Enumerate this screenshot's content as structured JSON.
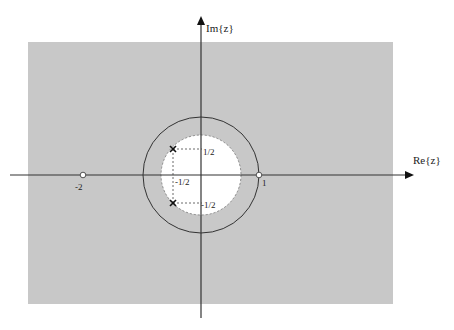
{
  "diagram": {
    "type": "pole-zero plot (z-plane, region of convergence)",
    "axes": {
      "real_label": "Re{z}",
      "imag_label": "Im{z}"
    },
    "roc": {
      "description": "shaded region |z| > 1/sqrt(2)",
      "shade_color": "#c8c8c8",
      "inner_disk_color": "#ffffff"
    },
    "unit_circle": {
      "radius": 1,
      "color": "#333333"
    },
    "zeros": [
      {
        "re": -2,
        "im": 0,
        "label": "-2"
      },
      {
        "re": 1,
        "im": 0,
        "label": "1"
      }
    ],
    "poles": [
      {
        "re": -0.5,
        "im": 0.5
      },
      {
        "re": -0.5,
        "im": -0.5
      }
    ],
    "guide_labels": {
      "pole_upper_im": "1/2",
      "pole_lower_im": "-1/2",
      "pole_re": "-1/2"
    }
  }
}
